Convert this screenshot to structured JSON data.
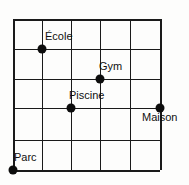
{
  "figure": {
    "title": "",
    "background_color": "#fdfdfc",
    "line_color": "#1a1a1a",
    "point_color": "#0d0d0d",
    "label_color": "#101010"
  },
  "grid": {
    "columns": 5,
    "rows": 5,
    "x_lines": [
      13,
      42,
      71,
      100,
      130,
      160
    ],
    "y_lines": [
      19,
      49,
      79,
      108,
      140,
      170
    ]
  },
  "points": [
    {
      "label": "École",
      "x": 42,
      "y": 49,
      "label_x": 45,
      "label_y": 31,
      "grid_col": 1,
      "grid_row": 1
    },
    {
      "label": "Gym",
      "x": 100,
      "y": 79,
      "label_x": 99,
      "label_y": 61,
      "grid_col": 3,
      "grid_row": 2
    },
    {
      "label": "Piscine",
      "x": 71,
      "y": 108,
      "label_x": 69,
      "label_y": 90,
      "grid_col": 2,
      "grid_row": 3
    },
    {
      "label": "Maison",
      "x": 160,
      "y": 108,
      "label_x": 142,
      "label_y": 112,
      "grid_col": 5,
      "grid_row": 3
    },
    {
      "label": "Parc",
      "x": 13,
      "y": 170,
      "label_x": 14,
      "label_y": 152,
      "grid_col": 0,
      "grid_row": 5
    }
  ]
}
